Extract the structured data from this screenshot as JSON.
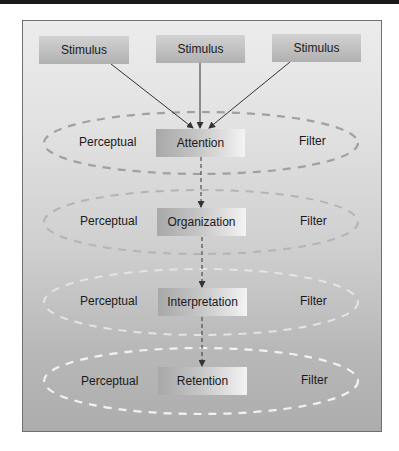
{
  "diagram": {
    "stimuli": [
      {
        "label": "Stimulus"
      },
      {
        "label": "Stimulus"
      },
      {
        "label": "Stimulus"
      }
    ],
    "stages": [
      {
        "label": "Attention",
        "left": "Perceptual",
        "right": "Filter"
      },
      {
        "label": "Organization",
        "left": "Perceptual",
        "right": "Filter"
      },
      {
        "label": "Interpretation",
        "left": "Perceptual",
        "right": "Filter"
      },
      {
        "label": "Retention",
        "left": "Perceptual",
        "right": "Filter"
      }
    ],
    "colors": {
      "frame_border": "#6f6f6f",
      "arrow": "#333333",
      "filter_dash_dark": "#9a9a9a",
      "filter_dash_light": "#f0f0f0"
    }
  }
}
